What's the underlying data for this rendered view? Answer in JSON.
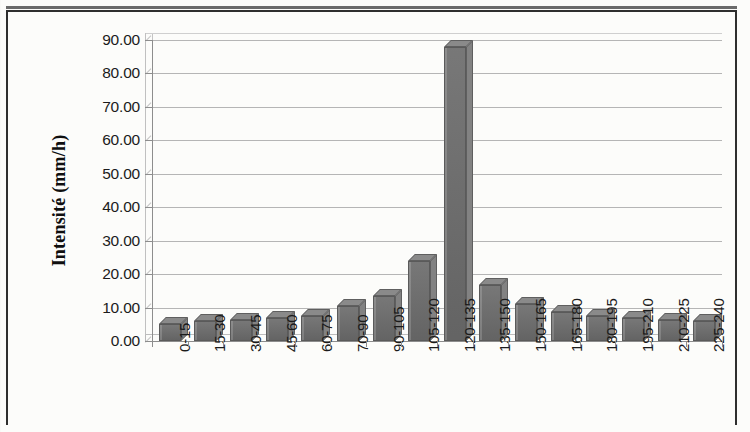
{
  "chart_data": {
    "type": "bar",
    "title": "",
    "subtitle": "",
    "xlabel": "",
    "ylabel": "Intensité (mm/h)",
    "categories": [
      "0-15",
      "15-30",
      "30-45",
      "45-60",
      "60-75",
      "70-90",
      "90-105",
      "105-120",
      "120-135",
      "135-150",
      "150-165",
      "165-180",
      "180-195",
      "195-210",
      "210-225",
      "225-240"
    ],
    "values": [
      5.2,
      6.0,
      6.3,
      6.9,
      7.6,
      10.5,
      13.4,
      23.8,
      88.0,
      16.8,
      11.2,
      8.7,
      7.4,
      7.0,
      6.3,
      5.9
    ],
    "ylim": [
      0,
      90
    ],
    "ytick_labels": [
      "0.00",
      "10.00",
      "20.00",
      "30.00",
      "40.00",
      "50.00",
      "60.00",
      "70.00",
      "80.00",
      "90.00"
    ],
    "ytick_values": [
      0,
      10,
      20,
      30,
      40,
      50,
      60,
      70,
      80,
      90
    ],
    "grid": true,
    "grid_axis": "y",
    "legend": false,
    "legend_position": "none",
    "series": [
      {
        "name": "Intensité",
        "values": [
          5.2,
          6.0,
          6.3,
          6.9,
          7.6,
          10.5,
          13.4,
          23.8,
          88.0,
          16.8,
          11.2,
          8.7,
          7.4,
          7.0,
          6.3,
          5.9
        ]
      }
    ],
    "style": {
      "bar_color": "#6f6f6f",
      "bar_top_color": "#8a8a8a",
      "bar_side_color": "#828282",
      "bar_border_color": "#5a5a5a",
      "grid_color": "#b5b5b5",
      "axis_color": "#8d8d8d",
      "text_color": "#1b1b1b",
      "frame_color": "#2e2e2e",
      "background": "#fcfcfa"
    }
  },
  "figure": {
    "frame_visible": true,
    "three_d": true
  }
}
